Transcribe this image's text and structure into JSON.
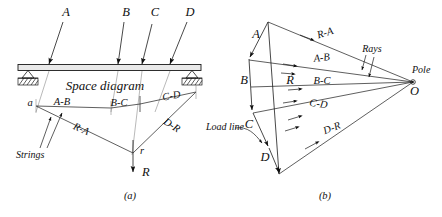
{
  "figure": {
    "title_space_diagram": "Space diagram",
    "captions": {
      "left": "(a)",
      "right": "(b)"
    }
  },
  "space_diagram": {
    "load_labels": [
      "A",
      "B",
      "C",
      "D"
    ],
    "title": "Space diagram"
  },
  "funicular": {
    "point_a": "a",
    "point_r": "r",
    "resultant": "R",
    "strings_note": "Strings",
    "string_labels": [
      "A-B",
      "B-C",
      "C-D",
      "D-R",
      "R-A"
    ]
  },
  "force_polygon": {
    "vertex_labels": [
      "A",
      "B",
      "C",
      "D"
    ],
    "resultant": "R",
    "load_line_note": "Load line",
    "rays_note": "Rays",
    "pole_label": "Pole",
    "pole_point": "O",
    "ray_labels": [
      "R-A",
      "A-B",
      "B-C",
      "C-D",
      "D-R"
    ]
  },
  "colors": {
    "ink": "#1a1a1a",
    "construction": "#8a8a8a",
    "beam_fill": "#e9e9e9"
  }
}
